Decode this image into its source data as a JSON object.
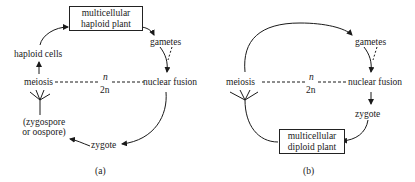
{
  "panel_a": {
    "box": [
      "multicellular",
      "haploid plant"
    ],
    "gametes": "gametes",
    "nuclear_fusion": "nuclear fusion",
    "zygote": "zygote",
    "spore_line1": "(zygospore",
    "spore_line2": "or oospore)",
    "meiosis": "meiosis",
    "haploid_cells": "haploid cells",
    "ploidy_top": "n",
    "ploidy_bottom": "2n",
    "caption": "(a)"
  },
  "panel_b": {
    "gametes": "gametes",
    "nuclear_fusion": "nuclear fusion",
    "zygote": "zygote",
    "box": [
      "multicellular",
      "diploid plant"
    ],
    "meiosis": "meiosis",
    "ploidy_top": "n",
    "ploidy_bottom": "2n",
    "caption": "(b)"
  },
  "colors": {
    "ink": "#1a1a1a",
    "background": "#ffffff"
  }
}
